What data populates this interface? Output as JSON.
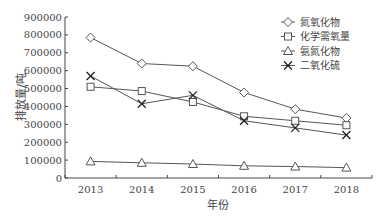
{
  "chart_data": {
    "type": "line",
    "title": "",
    "xlabel": "年份",
    "ylabel": "排放量/吨",
    "categories": [
      "2013",
      "2014",
      "2015",
      "2016",
      "2017",
      "2018"
    ],
    "ylim": [
      0,
      900000
    ],
    "yticks": [
      0,
      100000,
      200000,
      300000,
      400000,
      500000,
      600000,
      700000,
      800000,
      900000
    ],
    "grid": false,
    "legend_position": "upper right",
    "series": [
      {
        "name": "氮氧化物",
        "marker": "diamond",
        "values": [
          785000,
          640000,
          625000,
          478000,
          385000,
          335000
        ]
      },
      {
        "name": "化学需氧量",
        "marker": "square",
        "values": [
          510000,
          486000,
          425000,
          345000,
          320000,
          295000
        ]
      },
      {
        "name": "氨氮化物",
        "marker": "triangle",
        "values": [
          93000,
          85000,
          78000,
          68000,
          64000,
          58000
        ]
      },
      {
        "name": "二氧化硫",
        "marker": "x",
        "values": [
          570000,
          415000,
          462000,
          320000,
          280000,
          240000
        ]
      }
    ]
  },
  "colors": {
    "line": "#555555",
    "axis": "#444444",
    "text": "#444444"
  }
}
